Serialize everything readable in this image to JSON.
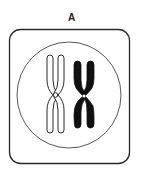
{
  "panel": {
    "label": "A",
    "description": "Cell containing a pair of homologous chromosomes"
  },
  "colors": {
    "stroke": "#2a2a2a",
    "fill_dark": "#111111",
    "fill_light": "#ffffff",
    "background": "#ffffff"
  },
  "elements": {
    "cell_frame": "rounded-square",
    "nucleus": "circle",
    "chromosomes": [
      {
        "name": "chromosome-light",
        "style": "outline"
      },
      {
        "name": "chromosome-dark",
        "style": "filled"
      }
    ]
  }
}
